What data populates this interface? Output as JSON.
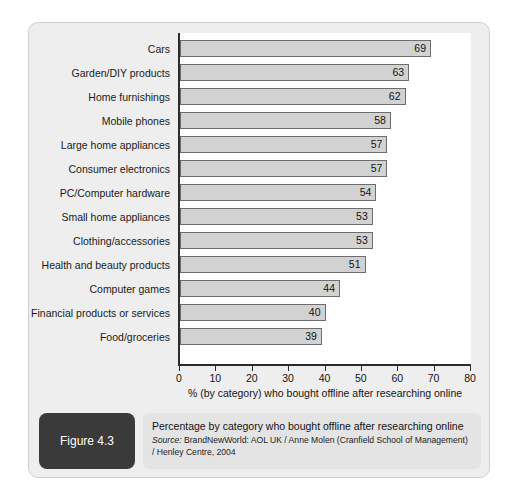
{
  "figure": {
    "badge_label": "Figure 4.3",
    "caption_title": "Percentage by category who bought offline after researching online",
    "source_prefix": "Source:",
    "source_text": " BrandNewWorld: AOL UK / Anne Molen (Cranfield School of Management) / Henley Centre, 2004"
  },
  "colors": {
    "card_background": "#eeeeee",
    "plot_background": "#ffffff",
    "bar_fill": "#d2d2d2",
    "bar_border": "#6d6d6d",
    "axis": "#2b2b2b",
    "badge_background": "#3a3a3a",
    "caption_background": "#e4e4e4"
  },
  "chart_data": {
    "type": "bar",
    "orientation": "horizontal",
    "title": "Percentage by category who bought offline after researching online",
    "xlabel": "% (by category) who bought offline after researching online",
    "ylabel": "",
    "xlim": [
      0,
      80
    ],
    "xticks": [
      0,
      10,
      20,
      30,
      40,
      50,
      60,
      70,
      80
    ],
    "grid": false,
    "legend": false,
    "categories": [
      "Cars",
      "Garden/DIY products",
      "Home furnishings",
      "Mobile phones",
      "Large home appliances",
      "Consumer electronics",
      "PC/Computer hardware",
      "Small home appliances",
      "Clothing/accessories",
      "Health and beauty products",
      "Computer games",
      "Financial products or services",
      "Food/groceries"
    ],
    "values": [
      69,
      63,
      62,
      58,
      57,
      57,
      54,
      53,
      53,
      51,
      44,
      40,
      39
    ]
  }
}
